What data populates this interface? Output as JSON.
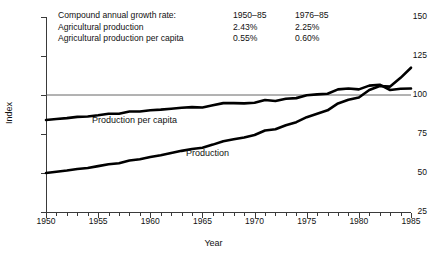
{
  "chart_data": {
    "type": "line",
    "title": "",
    "xlabel": "Year",
    "ylabel": "Index",
    "xlim": [
      1950,
      1985
    ],
    "ylim": [
      25,
      150
    ],
    "yticks": [
      150,
      125,
      100,
      75,
      50,
      25
    ],
    "xticks": [
      1950,
      1955,
      1960,
      1965,
      1970,
      1975,
      1980,
      1985
    ],
    "grid": false,
    "legend_position": "inline",
    "reference_line": {
      "value": 100,
      "label": "100"
    },
    "x": [
      1950,
      1951,
      1952,
      1953,
      1954,
      1955,
      1956,
      1957,
      1958,
      1959,
      1960,
      1961,
      1962,
      1963,
      1964,
      1965,
      1966,
      1967,
      1968,
      1969,
      1970,
      1971,
      1972,
      1973,
      1974,
      1975,
      1976,
      1977,
      1978,
      1979,
      1980,
      1981,
      1982,
      1983,
      1984,
      1985
    ],
    "series": [
      {
        "name": "Production",
        "label": "Production",
        "values": [
          50.0,
          50.8,
          51.6,
          52.6,
          53.2,
          54.4,
          55.6,
          56.3,
          58.0,
          58.8,
          60.2,
          61.4,
          62.8,
          64.2,
          65.4,
          66.2,
          68.2,
          70.4,
          71.6,
          72.8,
          74.4,
          77.2,
          78.0,
          80.6,
          82.6,
          85.8,
          88.0,
          90.2,
          94.6,
          97.0,
          98.4,
          103.2,
          105.8,
          105.4,
          111.0,
          117.5
        ]
      },
      {
        "name": "Production per capita",
        "label": "Production per capita",
        "values": [
          84.0,
          84.6,
          85.2,
          86.0,
          86.2,
          87.0,
          88.0,
          88.0,
          89.4,
          89.4,
          90.2,
          90.6,
          91.2,
          91.8,
          92.2,
          92.0,
          93.4,
          94.8,
          94.8,
          94.6,
          95.0,
          96.8,
          96.2,
          97.6,
          98.0,
          99.8,
          100.4,
          100.8,
          103.6,
          104.2,
          103.6,
          106.0,
          106.6,
          103.2,
          104.0,
          104.2
        ]
      }
    ]
  },
  "annotation": {
    "rows": [
      {
        "desc": "Compound annual growth rate:",
        "col1": "1950–85",
        "col2": "1976–85"
      },
      {
        "desc": "Agricultural production",
        "col1": "2.43%",
        "col2": "2.25%"
      },
      {
        "desc": "Agricultural production per capita",
        "col1": "0.55%",
        "col2": "0.60%"
      }
    ]
  },
  "colors": {
    "series_line": "#000000",
    "reference_line": "#555555",
    "axis": "#3a3a3a",
    "background": "#ffffff",
    "text": "#111111"
  }
}
